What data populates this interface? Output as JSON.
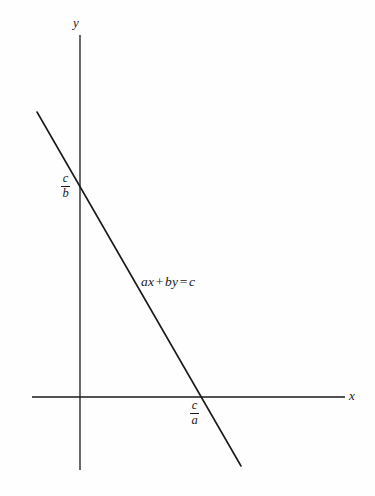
{
  "figure": {
    "type": "line-graph",
    "background_color": "#fefefe",
    "ink_color": "#1a1a1a"
  },
  "axes": {
    "x_label": "x",
    "y_label": "y",
    "x_axis": {
      "y": 397,
      "x_start": 32,
      "x_end": 345
    },
    "y_axis": {
      "x": 80,
      "y_start": 35,
      "y_end": 470
    },
    "origin": {
      "x": 80,
      "y": 397
    }
  },
  "line": {
    "equation_label": "ax + by = c",
    "equation_parts": {
      "term1": "ax",
      "operator_plus": "+",
      "term2": "by",
      "operator_equals": "=",
      "term3": "c"
    },
    "start": {
      "x": 37,
      "y": 112
    },
    "end": {
      "x": 241,
      "y": 466
    },
    "stroke_width": 1.6
  },
  "intercepts": {
    "y_intercept": {
      "label_numerator": "c",
      "label_denominator": "b",
      "point": {
        "x": 80,
        "y": 182
      }
    },
    "x_intercept": {
      "label_numerator": "c",
      "label_denominator": "a",
      "point": {
        "x": 205,
        "y": 397
      }
    }
  },
  "chart_data": {
    "type": "line",
    "title": "",
    "xlabel": "x",
    "ylabel": "y",
    "grid": false,
    "legend": "none",
    "annotations": [
      "ax + by = c",
      "c/b",
      "c/a"
    ],
    "series": [
      {
        "name": "ax + by = c",
        "x": [
          37,
          241
        ],
        "y_pixel": [
          112,
          466
        ],
        "intercepts": {
          "y": "c/b",
          "x": "c/a"
        },
        "slope_sign": "negative"
      }
    ]
  }
}
